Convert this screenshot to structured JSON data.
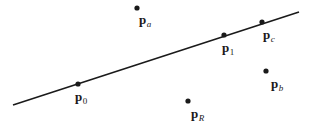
{
  "figure": {
    "type": "geometry-diagram",
    "background_color": "#ffffff",
    "ink_color": "#1a1a1a",
    "width": 313,
    "height": 131,
    "line": {
      "name": "infinite-line",
      "x1": 13,
      "y1": 105,
      "x2": 299,
      "y2": 12,
      "stroke_width": 1.6
    },
    "points": [
      {
        "id": "p0",
        "base": "p",
        "subscript": "0",
        "subscript_style": "upright",
        "dot_x": 78,
        "dot_y": 84,
        "dot_r": 2.6,
        "label_x": 75,
        "label_y": 90,
        "on_line": true
      },
      {
        "id": "p1",
        "base": "p",
        "subscript": "1",
        "subscript_style": "upright",
        "dot_x": 224,
        "dot_y": 35,
        "dot_r": 2.6,
        "label_x": 222,
        "label_y": 41,
        "on_line": true
      },
      {
        "id": "pc",
        "base": "p",
        "subscript": "c",
        "subscript_style": "italic",
        "dot_x": 262,
        "dot_y": 22,
        "dot_r": 2.6,
        "label_x": 263,
        "label_y": 28,
        "on_line": true
      },
      {
        "id": "pa",
        "base": "p",
        "subscript": "a",
        "subscript_style": "italic",
        "dot_x": 137,
        "dot_y": 8,
        "dot_r": 2.6,
        "label_x": 139,
        "label_y": 13,
        "on_line": false
      },
      {
        "id": "pb",
        "base": "p",
        "subscript": "b",
        "subscript_style": "italic",
        "dot_x": 266,
        "dot_y": 71,
        "dot_r": 2.6,
        "label_x": 271,
        "label_y": 77,
        "on_line": false
      },
      {
        "id": "pR",
        "base": "p",
        "subscript": "R",
        "subscript_style": "italic",
        "dot_x": 188,
        "dot_y": 101,
        "dot_r": 2.6,
        "label_x": 191,
        "label_y": 107,
        "on_line": false
      }
    ]
  }
}
